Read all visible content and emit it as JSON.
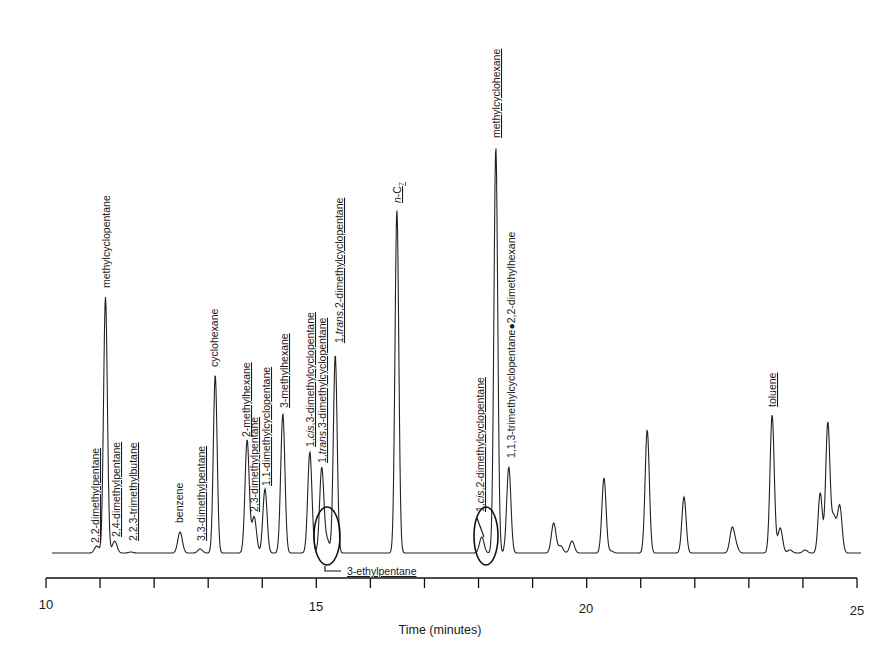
{
  "chart_data": {
    "type": "line",
    "title": "",
    "xlabel": "Time (minutes)",
    "ylabel": "",
    "xlim": [
      10,
      25
    ],
    "x_ticks": [
      10,
      15,
      20,
      25
    ],
    "x_minor_ticks": [
      11,
      12,
      13,
      14,
      16,
      17,
      18,
      19,
      21,
      22,
      23,
      24
    ],
    "grid": false,
    "baseline_y_px": 553,
    "peaks": [
      {
        "time": 10.94,
        "height": 7,
        "label": "2,2-dimethylpentane",
        "underlined": true
      },
      {
        "time": 11.1,
        "height": 256,
        "label": "methylcyclopentane",
        "underlined": false
      },
      {
        "time": 11.27,
        "height": 12,
        "label": "2,4-dimethylpentane",
        "underlined": true
      },
      {
        "time": 11.57,
        "height": 1,
        "label": "2,2,3-trimethylbutane",
        "underlined": true
      },
      {
        "time": 12.48,
        "height": 21,
        "label": "benzene",
        "underlined": false
      },
      {
        "time": 12.85,
        "height": 4,
        "label": "3,3-dimethylpentane",
        "underlined": true
      },
      {
        "time": 13.13,
        "height": 178,
        "label": "cyclohexane",
        "underlined": false
      },
      {
        "time": 13.72,
        "height": 113,
        "label": "2-methylhexane",
        "underlined": true
      },
      {
        "time": 13.85,
        "height": 36,
        "label": "2,3-dimethylpentane",
        "underlined": true
      },
      {
        "time": 14.05,
        "height": 64,
        "label": "1,1-dimethylcyclopentane",
        "underlined": true
      },
      {
        "time": 14.38,
        "height": 139,
        "label": "3-methylhexane",
        "underlined": true
      },
      {
        "time": 14.88,
        "height": 101,
        "label": "1,cis,3-dimethylcyclopentane",
        "underlined": true
      },
      {
        "time": 15.1,
        "height": 85,
        "label": "1,trans,3-dimethylcyclopentane",
        "underlined": true
      },
      {
        "time": 15.2,
        "height": 13,
        "label": "3-ethylpentane",
        "underlined": true,
        "circled": true
      },
      {
        "time": 15.35,
        "height": 198,
        "label": "1,trans,2-dimethylcyclopentane",
        "underlined": true
      },
      {
        "time": 16.49,
        "height": 343,
        "label": "n-C7",
        "underlined": true
      },
      {
        "time": 18.06,
        "height": 16,
        "label": "1,cis,2-dimethylcyclopentane",
        "underlined": true,
        "circled": true
      },
      {
        "time": 18.32,
        "height": 406,
        "label": "methylcyclohexane",
        "underlined": true
      },
      {
        "time": 18.56,
        "height": 86,
        "label": "1,1,3-trimethylcyclopentane+2,2-dimethylhexane",
        "underlined": false
      },
      {
        "time": 19.39,
        "height": 30,
        "label": ""
      },
      {
        "time": 19.52,
        "height": 7,
        "label": ""
      },
      {
        "time": 19.73,
        "height": 12,
        "label": ""
      },
      {
        "time": 20.32,
        "height": 75,
        "label": ""
      },
      {
        "time": 20.45,
        "height": 2,
        "label": ""
      },
      {
        "time": 21.12,
        "height": 123,
        "label": ""
      },
      {
        "time": 21.8,
        "height": 56,
        "label": ""
      },
      {
        "time": 22.69,
        "height": 24,
        "label": ""
      },
      {
        "time": 22.76,
        "height": 7,
        "label": ""
      },
      {
        "time": 23.43,
        "height": 138,
        "label": "toluene",
        "underlined": true
      },
      {
        "time": 23.58,
        "height": 25,
        "label": ""
      },
      {
        "time": 23.76,
        "height": 3,
        "label": ""
      },
      {
        "time": 24.04,
        "height": 3,
        "label": ""
      },
      {
        "time": 24.32,
        "height": 60,
        "label": ""
      },
      {
        "time": 24.46,
        "height": 130,
        "label": ""
      },
      {
        "time": 24.57,
        "height": 35,
        "label": ""
      },
      {
        "time": 24.68,
        "height": 47,
        "label": ""
      }
    ],
    "annotations": [
      {
        "type": "ellipse",
        "around_time": 15.15,
        "label": "3-ethylpentane"
      },
      {
        "type": "ellipse",
        "around_time": 18.15,
        "label": "1,cis,2-dimethylcyclopentane"
      }
    ]
  },
  "labels": {
    "p0": "2,2-dimethylpentane",
    "p1": "methylcyclopentane",
    "p2": "2,4-dimethylpentane",
    "p3": "2,2,3-trimethylbutane",
    "p4": "benzene",
    "p5": "3,3-dimethylpentane",
    "p6": "cyclohexane",
    "p7": "2-methylhexane",
    "p8": "2,3-dimethylpentane",
    "p9": "1,1-dimethylcyclopentane",
    "p10": "3-methylhexane",
    "p11a": "1,",
    "p11b": "cis",
    "p11c": ",3-dimethylcyclopentane",
    "p12a": "1,",
    "p12b": "trans",
    "p12c": ",3-dimethylcyclopentane",
    "p13": "3-ethylpentane",
    "p14a": "1,",
    "p14b": "trans",
    "p14c": ",2-dimethylcyclopentane",
    "p15a": "n",
    "p15b": "-C",
    "p15c": "7",
    "p16a": "1,",
    "p16b": "cis",
    "p16c": ",2-dimethylcyclopentane",
    "p17": "methylcyclohexane",
    "p18a": "1,1,3-trimethylcyclopentane",
    "p18b": "2,2-dimethylhexane",
    "p19": "toluene"
  },
  "axis": {
    "xlabel": "Time (minutes)",
    "t10": "10",
    "t15": "15",
    "t20": "20",
    "t25": "25"
  }
}
